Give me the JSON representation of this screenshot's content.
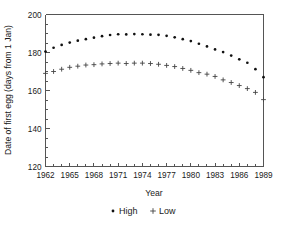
{
  "chart_data": {
    "type": "scatter",
    "title": "",
    "xlabel": "Year",
    "ylabel": "Date of first egg (days from 1 Jan)",
    "xlim": [
      1962,
      1989
    ],
    "ylim": [
      120,
      200
    ],
    "grid": false,
    "legend_position": "bottom-center",
    "x": [
      1962,
      1963,
      1964,
      1965,
      1966,
      1967,
      1968,
      1969,
      1970,
      1971,
      1972,
      1973,
      1974,
      1975,
      1976,
      1977,
      1978,
      1979,
      1980,
      1981,
      1982,
      1983,
      1984,
      1985,
      1986,
      1987,
      1988,
      1989
    ],
    "xticks": [
      1962,
      1965,
      1968,
      1971,
      1974,
      1977,
      1980,
      1983,
      1986,
      1989
    ],
    "xtick_labels": [
      "1962",
      "1965",
      "1968",
      "1971",
      "1974",
      "1977",
      "1980",
      "1983",
      "1986",
      "1989"
    ],
    "xminorticks": [
      1963,
      1964,
      1966,
      1967,
      1969,
      1970,
      1972,
      1973,
      1975,
      1976,
      1978,
      1979,
      1981,
      1982,
      1984,
      1985,
      1987,
      1988
    ],
    "yticks": [
      120,
      140,
      160,
      180,
      200
    ],
    "ytick_labels": [
      "120",
      "140",
      "160",
      "180",
      "200"
    ],
    "yminorticks": [
      125,
      130,
      135,
      145,
      150,
      155,
      165,
      170,
      175,
      185,
      190,
      195
    ],
    "series": [
      {
        "name": "High",
        "marker": "dot",
        "color": "#111111",
        "values": [
          180.5,
          182.5,
          184.0,
          185.2,
          186.2,
          187.0,
          187.8,
          188.6,
          189.2,
          189.6,
          189.5,
          189.7,
          189.6,
          189.4,
          189.3,
          188.8,
          188.0,
          187.0,
          186.0,
          184.6,
          183.2,
          181.6,
          180.2,
          178.4,
          176.4,
          174.6,
          171.2,
          167.0
        ]
      },
      {
        "name": "Low",
        "marker": "plus",
        "color": "#444444",
        "values": [
          169.0,
          170.0,
          171.2,
          172.2,
          172.8,
          173.4,
          173.6,
          174.0,
          174.2,
          174.4,
          174.2,
          174.4,
          174.4,
          174.2,
          173.8,
          173.2,
          172.6,
          171.6,
          170.6,
          169.4,
          168.6,
          167.4,
          165.6,
          164.2,
          162.6,
          161.0,
          159.0,
          155.2
        ]
      }
    ],
    "legend": [
      {
        "label": "High",
        "marker": "dot"
      },
      {
        "label": "Low",
        "marker": "plus"
      }
    ]
  }
}
